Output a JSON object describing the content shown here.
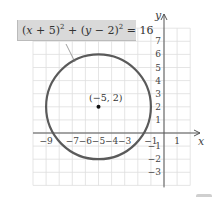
{
  "equation": {
    "label": "(x + 5)² + (y − 2)² = 16",
    "parts": [
      "(",
      "x",
      " + 5)",
      "2",
      " + (",
      "y",
      " − 2)",
      "2",
      " = 16"
    ]
  },
  "center_label": "(−5, 2)",
  "axes": {
    "x_label": "x",
    "y_label": "y",
    "x_ticks": [
      "−9",
      "−7",
      "−6",
      "−5",
      "−4",
      "−3",
      "−1",
      "1"
    ],
    "y_ticks": [
      "7",
      "6",
      "5",
      "4",
      "3",
      "2",
      "1",
      "−1",
      "−2",
      "−3"
    ]
  },
  "circle": {
    "center_x": -5,
    "center_y": 2,
    "radius": 4
  },
  "colors": {
    "grid": "#dcdcdc",
    "axis": "#555555",
    "circle": "#555555",
    "label_box": "#d9d9d9",
    "text": "#333333"
  }
}
